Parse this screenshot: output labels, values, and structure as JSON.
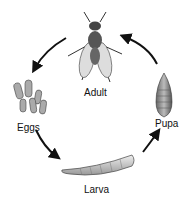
{
  "diagram": {
    "stages": [
      {
        "id": "adult",
        "label": "Adult"
      },
      {
        "id": "eggs",
        "label": "Eggs"
      },
      {
        "id": "larva",
        "label": "Larva"
      },
      {
        "id": "pupa",
        "label": "Pupa"
      }
    ],
    "cycle_order": [
      "Adult",
      "Eggs",
      "Larva",
      "Pupa",
      "Adult"
    ]
  }
}
